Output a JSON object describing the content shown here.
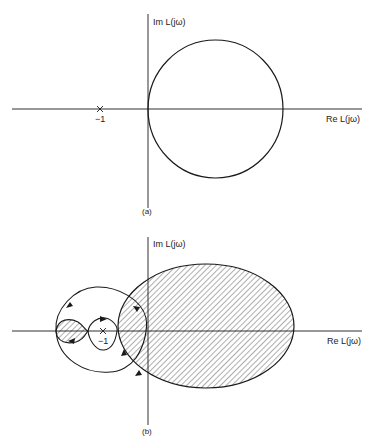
{
  "figure_a": {
    "caption": "(a)",
    "y_axis_label": "Im L(jω)",
    "x_axis_label": "Re L(jω)",
    "critical_point_label": "−1"
  },
  "figure_b": {
    "caption": "(b)",
    "y_axis_label": "Im L(jω)",
    "x_axis_label": "Re L(jω)",
    "critical_point_label": "−1"
  },
  "colors": {
    "line": "#1a1a1a",
    "hatch": "#333333",
    "background": "#ffffff"
  }
}
